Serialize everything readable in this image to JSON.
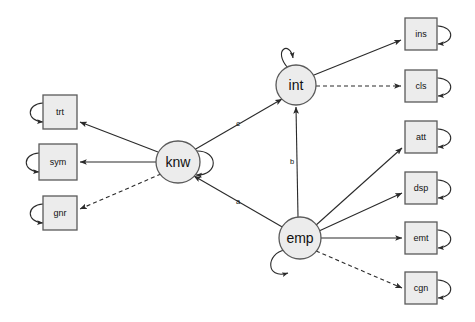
{
  "diagram": {
    "type": "sem-path-diagram",
    "title": "",
    "canvas": {
      "width": 475,
      "height": 322,
      "background": "#ffffff"
    },
    "style": {
      "node_fill": "#ececec",
      "node_stroke": "#5a5a5a",
      "edge_color": "#2a2a2a"
    },
    "nodes": [
      {
        "id": "trt",
        "label": "trt",
        "shape": "rect",
        "x": 60,
        "y": 112,
        "w": 34,
        "h": 34
      },
      {
        "id": "sym",
        "label": "sym",
        "shape": "rect",
        "x": 58,
        "y": 162,
        "w": 38,
        "h": 36
      },
      {
        "id": "gnr",
        "label": "gnr",
        "shape": "rect",
        "x": 60,
        "y": 213,
        "w": 34,
        "h": 34
      },
      {
        "id": "knw",
        "label": "knw",
        "shape": "ellipse",
        "x": 178,
        "y": 162,
        "rx": 22,
        "ry": 21
      },
      {
        "id": "int",
        "label": "int",
        "shape": "ellipse",
        "x": 296,
        "y": 85,
        "rx": 20,
        "ry": 20
      },
      {
        "id": "emp",
        "label": "emp",
        "shape": "ellipse",
        "x": 300,
        "y": 238,
        "rx": 21,
        "ry": 21
      },
      {
        "id": "ins",
        "label": "ins",
        "shape": "rect",
        "x": 421,
        "y": 34,
        "w": 32,
        "h": 32
      },
      {
        "id": "cls",
        "label": "cls",
        "shape": "rect",
        "x": 421,
        "y": 86,
        "w": 32,
        "h": 32
      },
      {
        "id": "att",
        "label": "att",
        "shape": "rect",
        "x": 421,
        "y": 137,
        "w": 32,
        "h": 32
      },
      {
        "id": "dsp",
        "label": "dsp",
        "shape": "rect",
        "x": 421,
        "y": 188,
        "w": 32,
        "h": 32
      },
      {
        "id": "emt",
        "label": "emt",
        "shape": "rect",
        "x": 421,
        "y": 238,
        "w": 32,
        "h": 32
      },
      {
        "id": "cgn",
        "label": "cgn",
        "shape": "rect",
        "x": 421,
        "y": 288,
        "w": 32,
        "h": 32
      }
    ],
    "edges": [
      {
        "id": "knw-trt",
        "from": "knw",
        "to": "trt",
        "style": "solid",
        "label": ""
      },
      {
        "id": "knw-sym",
        "from": "knw",
        "to": "sym",
        "style": "solid",
        "label": ""
      },
      {
        "id": "knw-gnr",
        "from": "knw",
        "to": "gnr",
        "style": "dashed",
        "label": ""
      },
      {
        "id": "knw-int",
        "from": "knw",
        "to": "int",
        "style": "solid",
        "label": "c"
      },
      {
        "id": "emp-knw",
        "from": "emp",
        "to": "knw",
        "style": "solid",
        "label": "a"
      },
      {
        "id": "emp-int",
        "from": "emp",
        "to": "int",
        "style": "solid",
        "label": "b"
      },
      {
        "id": "int-ins",
        "from": "int",
        "to": "ins",
        "style": "solid",
        "label": ""
      },
      {
        "id": "int-cls",
        "from": "int",
        "to": "cls",
        "style": "dashed",
        "label": ""
      },
      {
        "id": "emp-att",
        "from": "emp",
        "to": "att",
        "style": "solid",
        "label": ""
      },
      {
        "id": "emp-dsp",
        "from": "emp",
        "to": "dsp",
        "style": "solid",
        "label": ""
      },
      {
        "id": "emp-emt",
        "from": "emp",
        "to": "emt",
        "style": "solid",
        "label": ""
      },
      {
        "id": "emp-cgn",
        "from": "emp",
        "to": "cgn",
        "style": "dashed",
        "label": ""
      }
    ],
    "self_loops": [
      {
        "id": "loop-trt",
        "node": "trt",
        "side": "left"
      },
      {
        "id": "loop-sym",
        "node": "sym",
        "side": "left"
      },
      {
        "id": "loop-gnr",
        "node": "gnr",
        "side": "left"
      },
      {
        "id": "loop-knw",
        "node": "knw",
        "side": "right"
      },
      {
        "id": "loop-int",
        "node": "int",
        "side": "top-left"
      },
      {
        "id": "loop-emp",
        "node": "emp",
        "side": "bottom-left"
      },
      {
        "id": "loop-ins",
        "node": "ins",
        "side": "right"
      },
      {
        "id": "loop-cls",
        "node": "cls",
        "side": "right"
      },
      {
        "id": "loop-att",
        "node": "att",
        "side": "right"
      },
      {
        "id": "loop-dsp",
        "node": "dsp",
        "side": "right"
      },
      {
        "id": "loop-emt",
        "node": "emt",
        "side": "right"
      },
      {
        "id": "loop-cgn",
        "node": "cgn",
        "side": "right"
      }
    ],
    "labels": {
      "trt": "trt",
      "sym": "sym",
      "gnr": "gnr",
      "knw": "knw",
      "int": "int",
      "emp": "emp",
      "ins": "ins",
      "cls": "cls",
      "att": "att",
      "dsp": "dsp",
      "emt": "emt",
      "cgn": "cgn",
      "path_a": "a",
      "path_b": "b",
      "path_c": "c"
    }
  }
}
